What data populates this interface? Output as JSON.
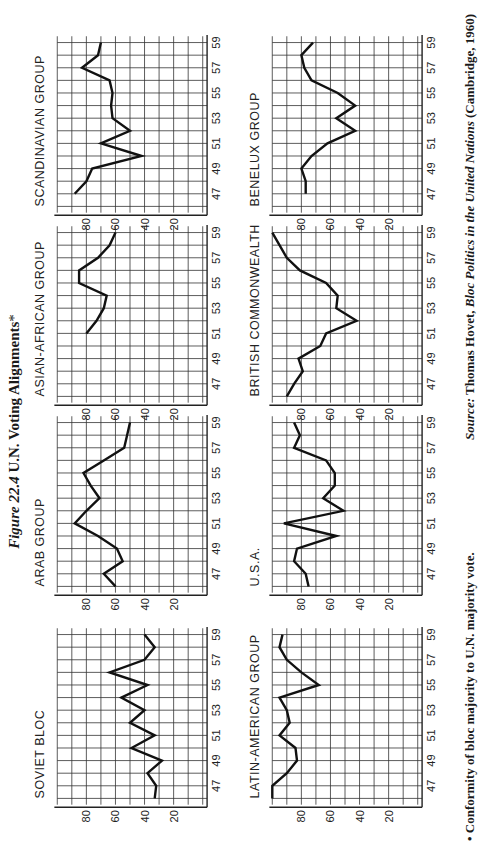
{
  "title": {
    "figure": "Figure 22.4",
    "text": "U.N. Voting Alignments",
    "marker": "*"
  },
  "footnote": "• Conformity of bloc majority to U.N. majority vote.",
  "source": {
    "label": "Source:",
    "author": "Thomas Hovet,",
    "book": "Bloc Politics in the United Nations",
    "publisher": "(Cambridge, 1960)"
  },
  "page_number": "505",
  "chart_data": [
    {
      "type": "line",
      "title": "SOVIET BLOC",
      "x": [
        1946,
        1947,
        1948,
        1949,
        1950,
        1951,
        1952,
        1953,
        1954,
        1955,
        1956,
        1957,
        1958,
        1959
      ],
      "values": [
        33,
        32,
        38,
        28,
        49,
        33,
        50,
        40,
        56,
        38,
        64,
        40,
        33,
        40
      ],
      "xticks": [
        "47",
        "49",
        "51",
        "53",
        "55",
        "57",
        "59"
      ],
      "yticks": [
        "20",
        "40",
        "60",
        "80"
      ],
      "ylim": [
        0,
        100
      ],
      "grid": true
    },
    {
      "type": "line",
      "title": "ARAB GROUP",
      "x": [
        1946,
        1947,
        1948,
        1949,
        1950,
        1951,
        1952,
        1953,
        1954,
        1955,
        1956,
        1957,
        1958,
        1959
      ],
      "values": [
        60,
        68,
        55,
        59,
        72,
        88,
        80,
        71,
        77,
        82,
        68,
        54,
        52,
        50
      ],
      "xticks": [
        "47",
        "49",
        "51",
        "53",
        "55",
        "57",
        "59"
      ],
      "yticks": [
        "20",
        "40",
        "60",
        "80"
      ],
      "ylim": [
        0,
        100
      ],
      "grid": true
    },
    {
      "type": "line",
      "title": "ASIAN-AFRICAN GROUP",
      "x": [
        1951,
        1952,
        1953,
        1954,
        1955,
        1956,
        1957,
        1958,
        1959
      ],
      "values": [
        80,
        73,
        68,
        66,
        85,
        85,
        72,
        64,
        60
      ],
      "xticks": [
        "47",
        "49",
        "51",
        "53",
        "55",
        "57",
        "59"
      ],
      "yticks": [
        "20",
        "40",
        "60",
        "80"
      ],
      "ylim": [
        0,
        100
      ],
      "grid": true
    },
    {
      "type": "line",
      "title": "SCANDINAVIAN GROUP",
      "x": [
        1947,
        1948,
        1949,
        1950,
        1951,
        1952,
        1953,
        1954,
        1955,
        1956,
        1957,
        1958,
        1959
      ],
      "values": [
        88,
        80,
        76,
        42,
        70,
        50,
        62,
        63,
        62,
        64,
        83,
        72,
        70
      ],
      "xticks": [
        "47",
        "49",
        "51",
        "53",
        "55",
        "57",
        "59"
      ],
      "yticks": [
        "20",
        "40",
        "60",
        "80"
      ],
      "ylim": [
        0,
        100
      ],
      "grid": true
    },
    {
      "type": "line",
      "title": "LATIN-AMERICAN GROUP",
      "x": [
        1946,
        1947,
        1948,
        1949,
        1950,
        1951,
        1952,
        1953,
        1954,
        1955,
        1956,
        1957,
        1958,
        1959
      ],
      "values": [
        100,
        100,
        90,
        83,
        84,
        95,
        88,
        90,
        95,
        68,
        80,
        90,
        95,
        93
      ],
      "xticks": [
        "47",
        "49",
        "51",
        "53",
        "55",
        "57",
        "59"
      ],
      "yticks": [
        "20",
        "40",
        "60",
        "80"
      ],
      "ylim": [
        0,
        100
      ],
      "grid": true
    },
    {
      "type": "line",
      "title": "U.S.A.",
      "x": [
        1946,
        1947,
        1948,
        1949,
        1950,
        1951,
        1952,
        1953,
        1954,
        1955,
        1956,
        1957,
        1958,
        1959
      ],
      "values": [
        75,
        77,
        85,
        83,
        56,
        92,
        51,
        65,
        57,
        57,
        63,
        85,
        81,
        85
      ],
      "xticks": [
        "47",
        "49",
        "51",
        "53",
        "55",
        "57",
        "59"
      ],
      "yticks": [
        "20",
        "40",
        "60",
        "80"
      ],
      "ylim": [
        0,
        100
      ],
      "grid": true
    },
    {
      "type": "line",
      "title": "BRITISH COMMONWEALTH",
      "x": [
        1946,
        1947,
        1948,
        1949,
        1950,
        1951,
        1952,
        1953,
        1954,
        1955,
        1956,
        1957,
        1958,
        1959
      ],
      "values": [
        90,
        85,
        79,
        82,
        67,
        63,
        42,
        56,
        55,
        63,
        81,
        90,
        95,
        100
      ],
      "xticks": [
        "47",
        "49",
        "51",
        "53",
        "55",
        "57",
        "59"
      ],
      "yticks": [
        "20",
        "40",
        "60",
        "80"
      ],
      "ylim": [
        0,
        100
      ],
      "grid": true
    },
    {
      "type": "line",
      "title": "BENELUX GROUP",
      "x": [
        1947,
        1948,
        1949,
        1950,
        1951,
        1952,
        1953,
        1954,
        1955,
        1956,
        1957,
        1958,
        1959
      ],
      "values": [
        77,
        77,
        80,
        73,
        62,
        43,
        56,
        43,
        55,
        73,
        78,
        80,
        72
      ],
      "xticks": [
        "47",
        "49",
        "51",
        "53",
        "55",
        "57",
        "59"
      ],
      "yticks": [
        "20",
        "40",
        "60",
        "80"
      ],
      "ylim": [
        0,
        100
      ],
      "grid": true
    }
  ]
}
